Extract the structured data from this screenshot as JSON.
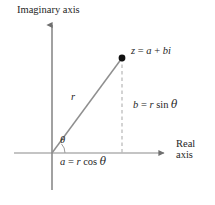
{
  "figure": {
    "name": "complex-number-polar-form-diagram",
    "axes": {
      "imaginary_label": "Imaginary axis",
      "real_label_line1": "Real",
      "real_label_line2": "axis"
    },
    "labels": {
      "point": {
        "lhs": "z",
        "eq": "=",
        "rhs_a": "a",
        "plus": "+",
        "rhs_bi": "bi"
      },
      "vertical_leg": {
        "lhs": "b",
        "eq": "=",
        "radius": "r",
        "fn": "sin",
        "angle": "θ"
      },
      "horizontal_leg": {
        "lhs": "a",
        "eq": "=",
        "radius": "r",
        "fn": "cos",
        "angle": "θ"
      },
      "radius": "r",
      "angle": "θ"
    },
    "colors": {
      "axis": "#8a8a8a",
      "ray": "#8f8f8f",
      "dashed": "#b0b0b0",
      "point": "#111111",
      "text": "#262626",
      "background": "#ffffff"
    },
    "geometry": {
      "origin": {
        "x": 52,
        "y": 153
      },
      "point": {
        "x": 122,
        "y": 58
      },
      "real_axis": {
        "x1": 14,
        "x2": 168,
        "y": 153
      },
      "imaginary_axis": {
        "x": 52,
        "y1": 21,
        "y2": 190
      },
      "point_dot_radius": 3.4,
      "angle_arc_radius": 13
    }
  }
}
